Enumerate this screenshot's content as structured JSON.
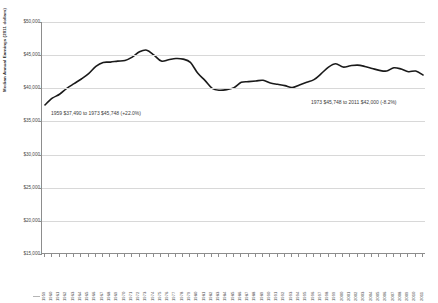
{
  "chart_data": {
    "type": "line",
    "title": "",
    "xlabel": "",
    "ylabel": "Median Annual Earnings (2011 dollars)",
    "ylim": [
      15000,
      50000
    ],
    "ytick_values": [
      50000,
      45000,
      40000,
      35000,
      30000,
      25000,
      20000,
      15000
    ],
    "ytick_labels": [
      "$50,000",
      "$45,000",
      "$40,000",
      "$35,000",
      "$30,000",
      "$25,000",
      "$20,000",
      "$15,000"
    ],
    "grid": true,
    "legend": "none",
    "line_color": "#1a1a1a",
    "x": [
      1959,
      1960,
      1961,
      1962,
      1963,
      1964,
      1965,
      1966,
      1967,
      1968,
      1969,
      1970,
      1971,
      1972,
      1973,
      1974,
      1975,
      1976,
      1977,
      1978,
      1979,
      1980,
      1981,
      1982,
      1983,
      1984,
      1985,
      1986,
      1987,
      1988,
      1989,
      1990,
      1991,
      1992,
      1993,
      1994,
      1995,
      1996,
      1997,
      1998,
      1999,
      2000,
      2001,
      2002,
      2003,
      2004,
      2005,
      2006,
      2007,
      2008,
      2009,
      2010,
      2011
    ],
    "values": [
      37490,
      38500,
      39100,
      40000,
      40700,
      41400,
      42200,
      43300,
      43900,
      43950,
      44100,
      44200,
      44700,
      45500,
      45748,
      45000,
      44100,
      44300,
      44500,
      44400,
      43900,
      42300,
      41200,
      40000,
      39700,
      39800,
      40100,
      40900,
      41000,
      41100,
      41200,
      40800,
      40600,
      40400,
      40100,
      40500,
      40900,
      41300,
      42200,
      43200,
      43700,
      43200,
      43400,
      43500,
      43300,
      43000,
      42700,
      42600,
      43100,
      42900,
      42500,
      42600,
      42000
    ],
    "annotations": [
      {
        "id": "left",
        "text": "1959 $37,490 to 1973 $45,748 (+22.0%)"
      },
      {
        "id": "right",
        "text": "1973 $45,748 to 2011 $42,000 (-8.2%)"
      }
    ],
    "xtick_labels": [
      "1959",
      "1960",
      "1961",
      "1962",
      "1963",
      "1964",
      "1965",
      "1966",
      "1967",
      "1968",
      "1969",
      "1970",
      "1971",
      "1972",
      "1973",
      "1974",
      "1975",
      "1976",
      "1977",
      "1978",
      "1979",
      "1980",
      "1981",
      "1982",
      "1983",
      "1984",
      "1985",
      "1986",
      "1987",
      "1988",
      "1989",
      "1990",
      "1991",
      "1992",
      "1993",
      "1994",
      "1995",
      "1996",
      "1997",
      "1998",
      "1999",
      "2000",
      "2001",
      "2002",
      "2003",
      "2004",
      "2005",
      "2006",
      "2007",
      "2008",
      "2009",
      "2010",
      "2011"
    ]
  }
}
